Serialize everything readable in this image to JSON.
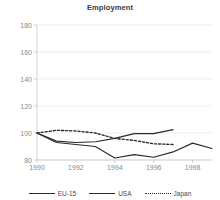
{
  "chart_data": {
    "type": "line",
    "title": "Employment",
    "xlabel": "",
    "ylabel": "",
    "x": [
      1990,
      1991,
      1992,
      1993,
      1994,
      1995,
      1996,
      1997,
      1998,
      1999
    ],
    "xlim": [
      1990,
      1999
    ],
    "ylim": [
      80,
      180
    ],
    "yticks": [
      80,
      100,
      120,
      140,
      160,
      180
    ],
    "xticks": [
      1990,
      1992,
      1994,
      1996,
      1998
    ],
    "ytick_labels": [
      "80",
      "100",
      "120",
      "140",
      "160",
      "180"
    ],
    "xtick_labels": [
      "1990",
      "1992",
      "1994",
      "1996",
      "1998"
    ],
    "grid": true,
    "legend_position": "bottom",
    "series": [
      {
        "name": "EU-15",
        "style": "solid",
        "color": "#2b2b2b",
        "x": [
          1990,
          1991,
          1992,
          1993,
          1994,
          1995,
          1996,
          1997,
          1998,
          1999
        ],
        "values": [
          100,
          93,
          91.5,
          90,
          81.5,
          84,
          82,
          86,
          92.5,
          88.5
        ]
      },
      {
        "name": "USA",
        "style": "solid",
        "color": "#2b2b2b",
        "x": [
          1990,
          1991,
          1992,
          1993,
          1994,
          1995,
          1996,
          1997
        ],
        "values": [
          100,
          94,
          93,
          93.5,
          96,
          99.5,
          99.5,
          102.5
        ]
      },
      {
        "name": "Japan",
        "style": "dotted",
        "color": "#2b2b2b",
        "x": [
          1990,
          1991,
          1992,
          1993,
          1994,
          1995,
          1996,
          1997
        ],
        "values": [
          100,
          102,
          101.5,
          100,
          96,
          94.5,
          92,
          91.5
        ]
      }
    ]
  },
  "legend": {
    "items": [
      {
        "label": "EU-15"
      },
      {
        "label": "USA"
      },
      {
        "label": "Japan"
      }
    ]
  }
}
